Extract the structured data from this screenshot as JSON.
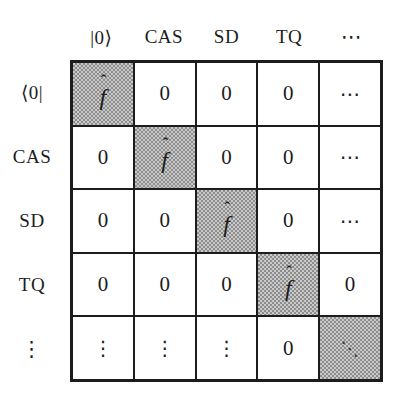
{
  "matrix": {
    "column_headers": [
      "|0⟩",
      "CAS",
      "SD",
      "TQ",
      "⋯"
    ],
    "row_headers": [
      "⟨0|",
      "CAS",
      "SD",
      "TQ",
      "⋮"
    ],
    "cells": [
      [
        "f̂",
        "0",
        "0",
        "0",
        "⋯"
      ],
      [
        "0",
        "f̂",
        "0",
        "0",
        "⋯"
      ],
      [
        "0",
        "0",
        "f̂",
        "0",
        "⋯"
      ],
      [
        "0",
        "0",
        "0",
        "f̂",
        "0"
      ],
      [
        "⋮",
        "⋮",
        "⋮",
        "0",
        "⋱"
      ]
    ]
  },
  "symbols": {
    "f_base": "f",
    "f_accent": "ˆ",
    "zero": "0",
    "cdots": "⋯",
    "vdots": "⋮",
    "ddots": "⋱"
  },
  "colors": {
    "background": "#ffffff",
    "grid_line": "#1c1c1c",
    "shaded_fill_dark": "#8d8d8d",
    "shaded_fill_light": "#c9c9c9",
    "text": "#1c1c1c"
  }
}
